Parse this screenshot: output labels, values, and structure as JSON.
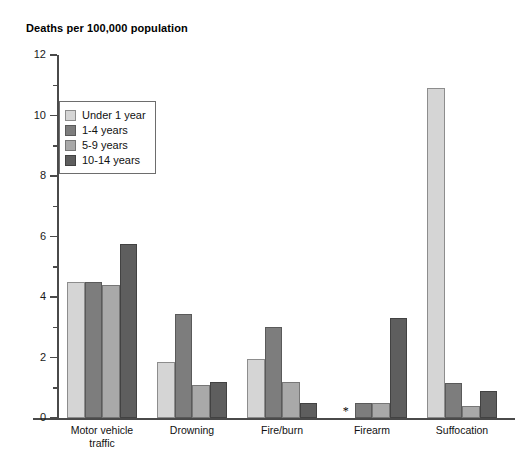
{
  "chart_data": {
    "type": "bar",
    "title": "Deaths per 100,000 population",
    "xlabel": "",
    "ylabel": "",
    "ylim": [
      0,
      12
    ],
    "ytick_labels": [
      "0",
      "2",
      "4",
      "6",
      "8",
      "10",
      "12"
    ],
    "ytick_values": [
      0,
      2,
      4,
      6,
      8,
      10,
      12
    ],
    "minor_tick_step": 1,
    "grid": false,
    "legend_position": "upper-left-inside",
    "categories": [
      "Motor vehicle traffic",
      "Drowning",
      "Fire/burn",
      "Firearm",
      "Suffocation"
    ],
    "series": [
      {
        "name": "Under 1 year",
        "color": "#d5d5d5",
        "values": [
          4.5,
          1.85,
          1.95,
          null,
          10.9
        ]
      },
      {
        "name": "1-4 years",
        "color": "#7d7d7d",
        "values": [
          4.5,
          3.45,
          3.0,
          0.5,
          1.15
        ]
      },
      {
        "name": "5-9 years",
        "color": "#a9a9a9",
        "values": [
          4.4,
          1.1,
          1.2,
          0.5,
          0.4
        ]
      },
      {
        "name": "10-14 years",
        "color": "#5e5e5e",
        "values": [
          5.75,
          1.2,
          0.5,
          3.3,
          0.9
        ]
      }
    ],
    "annotations": [
      {
        "text": "*",
        "category": "Firearm",
        "series": "Under 1 year",
        "note": "asterisk marks suppressed / unreliable value"
      }
    ]
  }
}
